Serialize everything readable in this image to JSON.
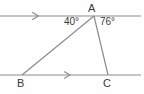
{
  "figure": {
    "background_color": "#fefefe",
    "stroke_color": "#8c8c8c",
    "label_color": "#3a3a3a"
  },
  "vertices": {
    "A": {
      "label": "A",
      "x": 94,
      "y": 16
    },
    "B": {
      "label": "B",
      "x": 22,
      "y": 75
    },
    "C": {
      "label": "C",
      "x": 108,
      "y": 75
    }
  },
  "angles": {
    "at_A_left": {
      "label": "40°",
      "value": 40,
      "unit": "degrees"
    },
    "at_A_right": {
      "label": "76°",
      "value": 76,
      "unit": "degrees"
    }
  },
  "lines": {
    "top_parallel": {
      "name": "upper-parallel-line",
      "x1": 0,
      "y1": 16,
      "x2": 141,
      "y2": 16,
      "tick_marker": "single-arrow",
      "marker_x": 36
    },
    "bottom_parallel": {
      "name": "lower-parallel-line",
      "x1": 0,
      "y1": 75,
      "x2": 141,
      "y2": 75,
      "tick_marker": "single-arrow",
      "marker_x": 68
    }
  },
  "segments": {
    "AB": {
      "name": "segment-ab",
      "from": "A",
      "to": "B"
    },
    "AC": {
      "name": "segment-ac",
      "from": "A",
      "to": "C"
    }
  }
}
